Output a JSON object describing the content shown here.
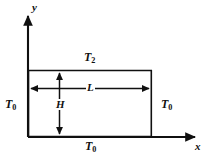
{
  "figure": {
    "axes": {
      "x_label": "x",
      "y_label": "y",
      "origin_x": 28,
      "origin_y": 137,
      "x_axis_end": 198,
      "y_axis_end": 14
    },
    "domain": {
      "left": 28,
      "top": 70,
      "right": 152,
      "bottom": 137
    },
    "boundary_labels": {
      "top": {
        "symbol": "T",
        "subscript": "2"
      },
      "left": {
        "symbol": "T",
        "subscript": "0"
      },
      "right": {
        "symbol": "T",
        "subscript": "0"
      },
      "bottom": {
        "symbol": "T",
        "subscript": "0"
      }
    },
    "dimensions": {
      "width_label": "L",
      "height_label": "H"
    },
    "colors": {
      "stroke": "#101010",
      "background": "#ffffff"
    },
    "stroke_width": 1.6
  }
}
